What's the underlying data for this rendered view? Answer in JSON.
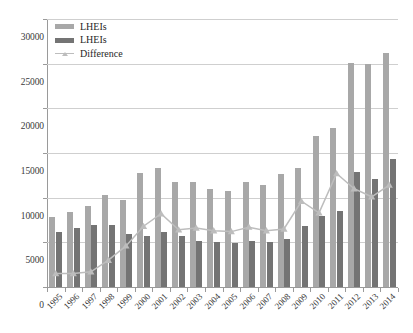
{
  "chart_data": {
    "type": "bar",
    "title": "",
    "xlabel": "",
    "ylabel": "",
    "ylim": [
      0,
      30000
    ],
    "ytick_step": 5000,
    "yticks": [
      "0",
      "5000",
      "10000",
      "15000",
      "20000",
      "25000",
      "30000"
    ],
    "grid": true,
    "legend_position": "top-left",
    "categories": [
      "1995",
      "1996",
      "1997",
      "1998",
      "1999",
      "2000",
      "2001",
      "2002",
      "2003",
      "2004",
      "2005",
      "2006",
      "2007",
      "2008",
      "2009",
      "2010",
      "2011",
      "2012",
      "2013",
      "2014"
    ],
    "series": [
      {
        "name": "LHEIs",
        "type": "bar",
        "color": "#a8a8a8",
        "values": [
          7800,
          8400,
          9100,
          10300,
          9700,
          12800,
          13300,
          11800,
          11700,
          11000,
          10800,
          11800,
          11400,
          12700,
          13300,
          16900,
          17800,
          25100,
          25000,
          26200
        ]
      },
      {
        "name": "LHEIs",
        "type": "bar",
        "color": "#747474",
        "values": [
          6200,
          6600,
          6900,
          6900,
          5900,
          5700,
          6200,
          5700,
          5100,
          5000,
          4900,
          5100,
          5000,
          5400,
          6800,
          8000,
          8500,
          12900,
          12100,
          14300
        ]
      },
      {
        "name": "Difference",
        "type": "line",
        "color": "#bdbdbd",
        "marker": "triangle",
        "values": [
          1500,
          1500,
          1700,
          3000,
          4600,
          6800,
          8200,
          6400,
          6600,
          6300,
          6200,
          6700,
          6300,
          6500,
          9600,
          8300,
          12700,
          11000,
          10100,
          11400
        ]
      }
    ]
  },
  "legend": {
    "items": [
      {
        "label": "LHEIs",
        "kind": "bar",
        "color": "#a8a8a8"
      },
      {
        "label": "LHEIs",
        "kind": "bar",
        "color": "#747474"
      },
      {
        "label": "Difference",
        "kind": "line",
        "color": "#bdbdbd"
      }
    ]
  }
}
